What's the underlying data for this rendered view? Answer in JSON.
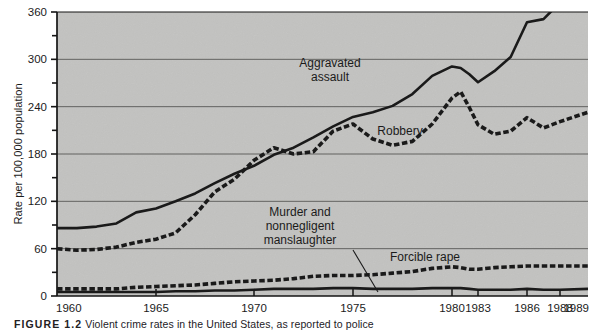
{
  "figure": {
    "caption_label": "FIGURE 1.2",
    "caption_text": "Violent crime rates in the United States, as reported to police"
  },
  "chart_data": {
    "type": "line",
    "title": "",
    "xlabel": "",
    "ylabel": "Rate per 100,000 population",
    "ylim": [
      0,
      360
    ],
    "ytick_values": [
      0,
      60,
      120,
      180,
      240,
      300,
      360
    ],
    "ytick_labels": [
      "0",
      "60",
      "120",
      "180",
      "240",
      "300",
      "360"
    ],
    "yminor_values": [
      30,
      90,
      150,
      210,
      270,
      330
    ],
    "grid": true,
    "grid_axis": "y",
    "legend": "inline-annotations",
    "x_axis_type": "categorical-uneven",
    "xtick_labels": [
      "1960",
      "1965",
      "1970",
      "1975",
      "1980",
      "1983",
      "1986",
      "1988",
      "1989"
    ],
    "xtick_years": [
      1960,
      1965,
      1970,
      1975,
      1980,
      1983,
      1986,
      1988,
      1989
    ],
    "x": [
      1960,
      1961,
      1962,
      1963,
      1964,
      1965,
      1966,
      1967,
      1968,
      1969,
      1970,
      1971,
      1972,
      1973,
      1974,
      1975,
      1976,
      1977,
      1978,
      1979,
      1980,
      1981,
      1982,
      1983,
      1984,
      1985,
      1986,
      1987,
      1988,
      1989
    ],
    "series": [
      {
        "name": "Aggravated assault",
        "style": "solid",
        "color": "#1a1a1a",
        "label_x": 1974,
        "label_y": 300,
        "values": [
          86,
          86,
          88,
          92,
          106,
          111,
          120,
          130,
          143,
          155,
          165,
          179,
          188,
          201,
          215,
          227,
          233,
          241,
          256,
          279,
          291,
          289,
          281,
          271,
          285,
          303,
          347,
          351,
          372,
          383
        ]
      },
      {
        "name": "Robbery",
        "style": "dashed",
        "color": "#1a1a1a",
        "label_x": 1982,
        "label_y": 212,
        "values": [
          60,
          58,
          59,
          62,
          68,
          72,
          80,
          103,
          132,
          148,
          172,
          188,
          180,
          183,
          209,
          218,
          199,
          191,
          196,
          218,
          251,
          259,
          239,
          217,
          205,
          209,
          226,
          213,
          221,
          233
        ]
      },
      {
        "name": "Forcible rape",
        "style": "dashed",
        "color": "#1a1a1a",
        "label_x": 1981,
        "label_y": 62,
        "values": [
          9,
          9,
          9,
          9,
          11,
          12,
          13,
          14,
          16,
          18,
          19,
          20,
          22,
          25,
          26,
          26,
          27,
          29,
          31,
          35,
          37,
          36,
          34,
          34,
          36,
          37,
          38,
          38,
          38,
          38
        ]
      },
      {
        "name": "Murder and nonnegligent manslaughter",
        "style": "solid",
        "color": "#1a1a1a",
        "label_x": 1972,
        "label_y": 86,
        "values": [
          5,
          5,
          5,
          5,
          5,
          5,
          6,
          6,
          7,
          7,
          8,
          9,
          9,
          9,
          10,
          10,
          9,
          9,
          9,
          10,
          10,
          10,
          9,
          8,
          8,
          8,
          9,
          8,
          8,
          9
        ]
      }
    ],
    "annotations": [
      {
        "text": "Aggravated assault",
        "lines": [
          "Aggravated",
          "assault"
        ],
        "x_px": 330,
        "y_px": 67
      },
      {
        "text": "Robbery",
        "lines": [
          "Robbery"
        ],
        "x_px": 400,
        "y_px": 135
      },
      {
        "text": "Murder and nonnegligent manslaughter",
        "lines": [
          "Murder and",
          "nonnegligent",
          "manslaughter"
        ],
        "x_px": 300,
        "y_px": 216,
        "leader": true
      },
      {
        "text": "Forcible rape",
        "lines": [
          "Forcible rape"
        ],
        "x_px": 425,
        "y_px": 261
      }
    ]
  }
}
